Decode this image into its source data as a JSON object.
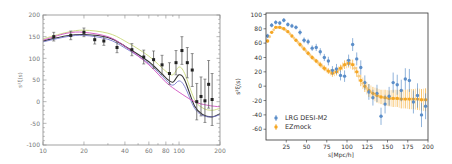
{
  "chart_data": [
    {
      "type": "line",
      "title": "",
      "xlabel": "",
      "ylabel": "s²ξ(s)",
      "xscale": "log",
      "xlim": [
        10,
        200
      ],
      "ylim": [
        -100,
        200
      ],
      "xticks": [
        10,
        20,
        40,
        60,
        80,
        100,
        200
      ],
      "xtick_labels": [
        "10",
        "20",
        "40",
        "60",
        "80",
        "100",
        "200"
      ],
      "yticks": [
        -100,
        -50,
        0,
        50,
        100,
        150,
        200
      ],
      "ytick_labels": [
        "-100",
        "-50",
        "0",
        "50",
        "100",
        "150",
        "200"
      ],
      "grid": false,
      "legend": null,
      "data_points": {
        "name": "data",
        "color": "#222222",
        "x": [
          12,
          16,
          20,
          24,
          28,
          35,
          45,
          55,
          65,
          75,
          85,
          95,
          105,
          115,
          125,
          135,
          145,
          155,
          165,
          175
        ],
        "y": [
          150,
          153,
          160,
          143,
          140,
          125,
          120,
          103,
          97,
          85,
          65,
          90,
          118,
          90,
          73,
          0,
          12,
          2,
          40,
          5
        ],
        "yerr": [
          10,
          10,
          10,
          10,
          10,
          12,
          14,
          16,
          20,
          22,
          25,
          28,
          32,
          35,
          38,
          42,
          45,
          50,
          55,
          60
        ]
      },
      "series": [
        {
          "name": "model-green",
          "color": "#c8d87a",
          "x": [
            10,
            15,
            20,
            30,
            40,
            60,
            80,
            90,
            100,
            110,
            130,
            150,
            175,
            200
          ],
          "y": [
            145,
            160,
            165,
            158,
            140,
            105,
            70,
            62,
            80,
            65,
            5,
            -15,
            -20,
            -15
          ]
        },
        {
          "name": "model-black",
          "color": "#333333",
          "x": [
            10,
            15,
            20,
            30,
            40,
            60,
            80,
            90,
            100,
            110,
            130,
            150,
            175,
            200
          ],
          "y": [
            140,
            152,
            155,
            148,
            128,
            92,
            55,
            45,
            62,
            50,
            -10,
            -30,
            -35,
            -28
          ]
        },
        {
          "name": "model-blue",
          "color": "#7a7ad0",
          "x": [
            10,
            15,
            20,
            30,
            40,
            60,
            80,
            90,
            100,
            110,
            130,
            150,
            175,
            200
          ],
          "y": [
            138,
            150,
            153,
            144,
            124,
            88,
            50,
            38,
            48,
            35,
            -15,
            -32,
            -35,
            -30
          ]
        },
        {
          "name": "model-magenta",
          "color": "#d050c0",
          "x": [
            10,
            15,
            20,
            30,
            40,
            60,
            80,
            100,
            130,
            160,
            200
          ],
          "y": [
            142,
            158,
            160,
            150,
            128,
            85,
            45,
            22,
            0,
            -8,
            -12
          ]
        }
      ]
    },
    {
      "type": "scatter",
      "title": "",
      "xlabel": "s[Mpc/h]",
      "ylabel": "s²ξ(s)",
      "xlim": [
        0,
        200
      ],
      "ylim": [
        -75,
        102
      ],
      "xticks": [
        25,
        50,
        75,
        100,
        125,
        150,
        175,
        200
      ],
      "xtick_labels": [
        "25",
        "50",
        "75",
        "100",
        "125",
        "150",
        "175",
        "200"
      ],
      "yticks": [
        -60,
        -40,
        -20,
        0,
        20,
        40,
        60,
        80,
        100
      ],
      "ytick_labels": [
        "-60",
        "-40",
        "-20",
        "0",
        "20",
        "40",
        "60",
        "80",
        "100"
      ],
      "grid": false,
      "legend": {
        "position": "lower left",
        "entries": [
          "LRG DESI-M2",
          "EZmock"
        ]
      },
      "series": [
        {
          "name": "LRG DESI-M2",
          "color": "#5b8ec9",
          "x": [
            2,
            7,
            12,
            17,
            22,
            27,
            32,
            37,
            42,
            47,
            52,
            57,
            62,
            67,
            72,
            77,
            82,
            87,
            92,
            97,
            102,
            107,
            112,
            117,
            122,
            127,
            132,
            137,
            142,
            147,
            152,
            157,
            162,
            167,
            172,
            177,
            182,
            187,
            192,
            197
          ],
          "y": [
            70,
            85,
            89,
            88,
            92,
            86,
            84,
            82,
            75,
            64,
            62,
            53,
            54,
            48,
            40,
            35,
            22,
            24,
            15,
            14,
            36,
            58,
            38,
            26,
            5,
            -8,
            -16,
            -10,
            -42,
            -25,
            -14,
            5,
            2,
            -6,
            10,
            8,
            -22,
            -13,
            -40,
            -28
          ],
          "yerr": [
            3,
            3,
            3,
            3,
            3,
            3,
            3,
            3,
            4,
            4,
            4,
            4,
            5,
            5,
            5,
            6,
            6,
            7,
            7,
            8,
            8,
            9,
            9,
            10,
            10,
            11,
            11,
            12,
            12,
            13,
            13,
            14,
            14,
            15,
            15,
            16,
            16,
            17,
            17,
            18
          ]
        },
        {
          "name": "EZmock",
          "color": "#f5a623",
          "x": [
            2,
            7,
            12,
            17,
            22,
            27,
            32,
            37,
            42,
            47,
            52,
            57,
            62,
            67,
            72,
            77,
            82,
            87,
            92,
            97,
            102,
            107,
            112,
            117,
            122,
            127,
            132,
            137,
            142,
            147,
            152,
            157,
            162,
            167,
            172,
            177,
            182,
            187,
            192,
            197
          ],
          "y": [
            63,
            75,
            82,
            82,
            80,
            76,
            70,
            64,
            58,
            52,
            46,
            40,
            35,
            30,
            25,
            21,
            18,
            20,
            25,
            30,
            32,
            30,
            20,
            8,
            0,
            -6,
            -10,
            -13,
            -15,
            -16,
            -17,
            -17,
            -17,
            -18,
            -18,
            -18,
            -18,
            -18,
            -19,
            -19
          ],
          "yerr": [
            2,
            2,
            2,
            2,
            2,
            2,
            2,
            2,
            3,
            3,
            3,
            3,
            3,
            4,
            4,
            4,
            5,
            5,
            5,
            6,
            6,
            7,
            7,
            8,
            8,
            9,
            9,
            10,
            10,
            11,
            11,
            12,
            12,
            13,
            13,
            14,
            14,
            15,
            15,
            16
          ]
        }
      ]
    }
  ]
}
